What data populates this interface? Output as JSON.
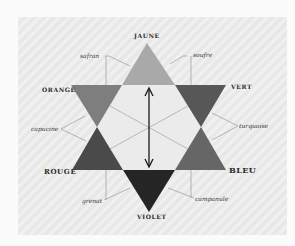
{
  "diagram": {
    "primary_labels": {
      "top": "JAUNE",
      "upper_right": "VERT",
      "lower_right": "BLEU",
      "bottom": "VIOLET",
      "lower_left": "ROUGE",
      "upper_left": "ORANGE"
    },
    "secondary_labels": {
      "upper_left": "safran",
      "upper_right": "soufre",
      "left": "capucine",
      "right": "turquoise",
      "lower_left": "grenat",
      "lower_right": "campanule"
    },
    "colors": {
      "background": "#fbfbfb",
      "panel": "#e8e8e8",
      "jaune": "#a9a9a9",
      "orange": "#7e7e7e",
      "vert": "#575757",
      "rouge": "#4a4a4a",
      "bleu": "#666666",
      "violet": "#252525",
      "center": "#ebebeb",
      "line": "#9a9a9a",
      "arrow": "#1a1a1a"
    },
    "center_arrow": "double-headed vertical arrow"
  }
}
